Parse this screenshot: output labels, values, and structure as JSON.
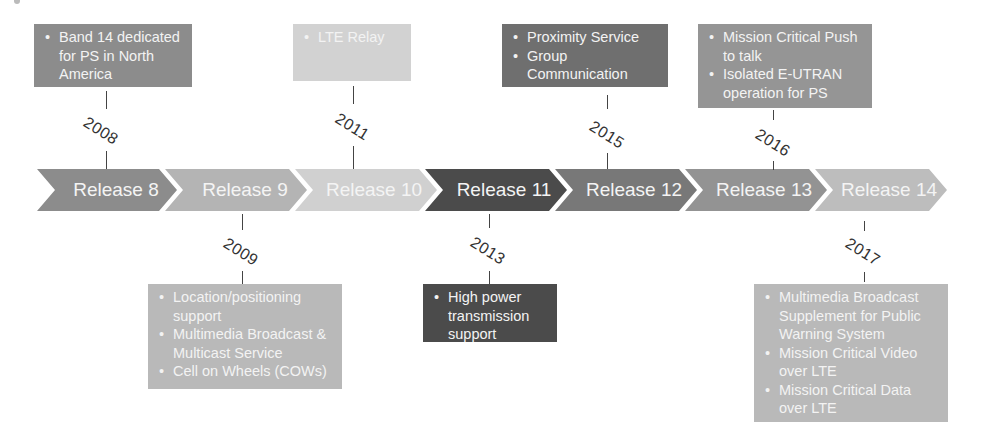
{
  "diagram": {
    "type": "timeline",
    "releases": [
      {
        "label": "Release 8",
        "color": "#8c8c8c"
      },
      {
        "label": "Release 9",
        "color": "#b4b4b4"
      },
      {
        "label": "Release 10",
        "color": "#d0d0d0"
      },
      {
        "label": "Release 11",
        "color": "#4b4b4b"
      },
      {
        "label": "Release 12",
        "color": "#787878"
      },
      {
        "label": "Release 13",
        "color": "#939393"
      },
      {
        "label": "Release 14",
        "color": "#bdbdbd"
      }
    ],
    "milestones": [
      {
        "year": "2008",
        "release": "Release 8",
        "position": "above",
        "color": "#8c8c8c",
        "items": [
          "Band 14 dedicated for PS in North America"
        ]
      },
      {
        "year": "2009",
        "release": "Release 9",
        "position": "below",
        "color": "#b9b9b9",
        "items": [
          "Location/positioning support",
          "Multimedia Broadcast & Multicast Service",
          "Cell on Wheels (COWs)"
        ]
      },
      {
        "year": "2011",
        "release": "Release 10",
        "position": "above",
        "color": "#d2d2d2",
        "items": [
          "LTE Relay"
        ]
      },
      {
        "year": "2013",
        "release": "Release 11",
        "position": "below",
        "color": "#4b4b4b",
        "items": [
          "High power transmission support"
        ]
      },
      {
        "year": "2015",
        "release": "Release 12",
        "position": "above",
        "color": "#6f6f6f",
        "items": [
          "Proximity Service",
          "Group Communication"
        ]
      },
      {
        "year": "2016",
        "release": "Release 13",
        "position": "above",
        "color": "#959595",
        "items": [
          "Mission Critical Push to talk",
          "Isolated E-UTRAN operation for PS"
        ]
      },
      {
        "year": "2017",
        "release": "Release 14",
        "position": "below",
        "color": "#b9b9b9",
        "items": [
          "Multimedia Broadcast Supplement for Public Warning System",
          "Mission Critical Video over LTE",
          "Mission Critical Data over LTE"
        ]
      }
    ]
  }
}
